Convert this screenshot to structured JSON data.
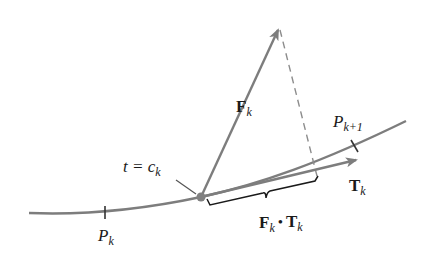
{
  "diagram": {
    "colors": {
      "curve": "#7d7d7d",
      "vector": "#7d7d7d",
      "dashed": "#8c8c8c",
      "brace": "#1a1a1a",
      "text": "#1a1a1a",
      "point": "#808080",
      "background": "#ffffff"
    },
    "labels": {
      "force_main": "F",
      "force_sub": "k",
      "tangent_main": "T",
      "tangent_sub": "k",
      "point_k_main": "P",
      "point_k_sub": "k",
      "point_k1_main": "P",
      "point_k1_sub": "k+1",
      "param_eq": "t = c",
      "param_sub": "k",
      "dot_F": "F",
      "dot_F_sub": "k",
      "dot_op": "•",
      "dot_T": "T",
      "dot_T_sub": "k"
    },
    "elements": {
      "curve": "smooth path from lower-left to upper-right",
      "force_vector": "arrow F_k from point at t=c_k up-right",
      "tangent_vector": "unit tangent arrow T_k along curve",
      "projection": "dashed line from tip of F_k perpendicular to T_k",
      "brace": "brace under T_k indicating projection length F_k · T_k",
      "ticks": [
        "P_k",
        "P_{k+1}"
      ]
    }
  }
}
